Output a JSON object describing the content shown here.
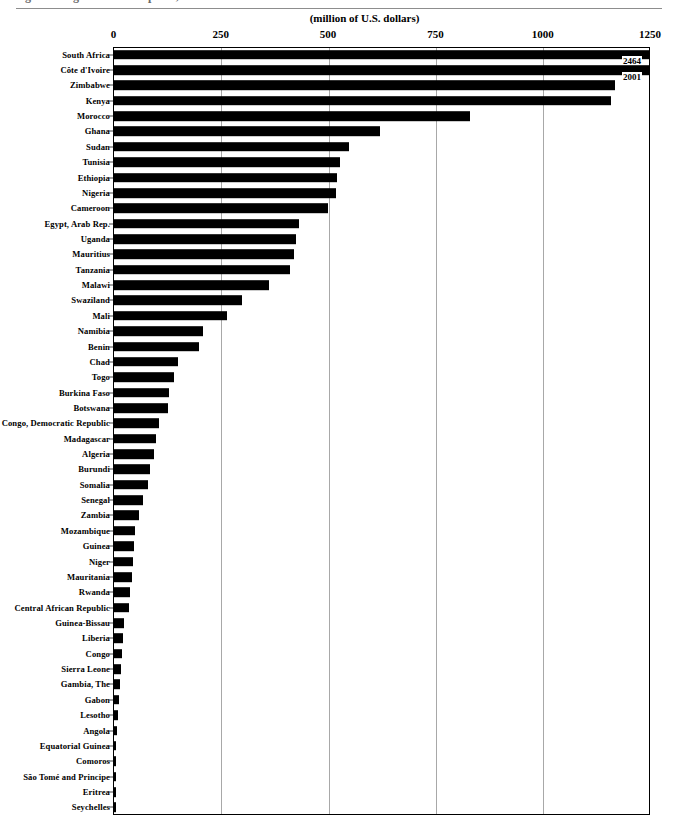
{
  "figure": {
    "cut_title": "Figure 1. Agricultural Exports, 2001",
    "unit_caption": "(million of U.S. dollars)"
  },
  "chart_data": {
    "type": "bar",
    "orientation": "horizontal",
    "title": "",
    "subtitle": "(million of U.S. dollars)",
    "xlabel": "(million of U.S. dollars)",
    "ylabel": "",
    "xlim": [
      0,
      1250
    ],
    "ylim": null,
    "grid": true,
    "legend": null,
    "xticks": [
      0,
      250,
      500,
      750,
      1000,
      1250
    ],
    "xtick_labels": [
      "0",
      "250",
      "500",
      "750",
      "1000",
      "1250"
    ],
    "annotations": [
      {
        "category": "South Africa",
        "text": "2464"
      },
      {
        "category": "Côte d'Ivoire",
        "text": "2001"
      }
    ],
    "note": "Bars for South Africa and Côte d'Ivoire exceed the axis maximum of 1250 and are drawn clipped at the plot edge with their true values labeled.",
    "categories": [
      "South Africa",
      "Côte d'Ivoire",
      "Zimbabwe",
      "Kenya",
      "Morocco",
      "Ghana",
      "Sudan",
      "Tunisia",
      "Ethiopia",
      "Nigeria",
      "Cameroon",
      "Egypt,  Arab Rep.",
      "Uganda",
      "Mauritius",
      "Tanzania",
      "Malawi",
      "Swaziland",
      "Mali",
      "Namibia",
      "Benin",
      "Chad",
      "Togo",
      "Burkina Faso",
      "Botswana",
      "Congo, Democratic  Republic",
      "Madagascar",
      "Algeria",
      "Burundi",
      "Somalia",
      "Senegal",
      "Zambia",
      "Mozambique",
      "Guinea",
      "Niger",
      "Mauritania",
      "Rwanda",
      "Central African Republic",
      "Guinea-Bissau",
      "Liberia",
      "Congo",
      "Sierra Leone",
      "Gambia, The",
      "Gabon",
      "Lesotho",
      "Angola",
      "Equatorial Guinea",
      "Comoros",
      "São Tomé and Principe",
      "Eritrea",
      "Seychelles"
    ],
    "values": [
      2464,
      2001,
      1168,
      1160,
      830,
      620,
      548,
      528,
      520,
      518,
      500,
      432,
      425,
      420,
      412,
      362,
      300,
      265,
      208,
      200,
      150,
      142,
      130,
      128,
      105,
      100,
      95,
      85,
      80,
      68,
      60,
      50,
      47,
      45,
      42,
      38,
      35,
      24,
      22,
      20,
      18,
      15,
      13,
      10,
      7,
      6,
      5,
      4,
      3,
      2
    ]
  }
}
